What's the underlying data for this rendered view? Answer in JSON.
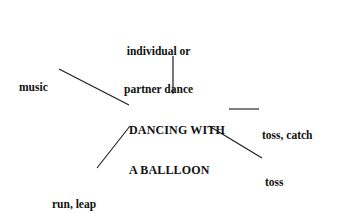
{
  "diagram": {
    "type": "mind-map",
    "title": "DANCING WITH A BALLLOON",
    "border_color": "#6b6b6b",
    "text_color": "#111111",
    "background": "#ffffff",
    "center": {
      "line1": "DANCING WITH",
      "line2": "A BALLLOON"
    },
    "branches": {
      "dance": {
        "line1": "individual or",
        "line2": "partner dance"
      },
      "music": {
        "label": "music"
      },
      "toss_catch": {
        "label": "toss, catch"
      },
      "toss_turn_catch": {
        "line1": "toss",
        "line2": "turn",
        "line3": "catch"
      },
      "run_leap": {
        "label": "run, leap"
      }
    }
  }
}
